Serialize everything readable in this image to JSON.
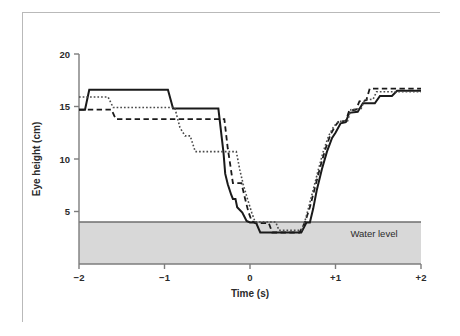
{
  "figure": {
    "frame_color": "#b9b9b9",
    "background": "#ffffff"
  },
  "chart_data": {
    "type": "line",
    "title": "",
    "subtitle": "",
    "xlabel": "Time (s)",
    "ylabel": "Eye height (cm)",
    "xlim": [
      -2,
      2
    ],
    "ylim": [
      0,
      20
    ],
    "xticks": [
      -2,
      -1,
      0,
      1,
      2
    ],
    "xtick_labels": [
      "−2",
      "−1",
      "0",
      "+1",
      "+2"
    ],
    "yticks": [
      5,
      10,
      15,
      20
    ],
    "ytick_labels": [
      "5",
      "10",
      "15",
      "20"
    ],
    "grid": false,
    "legend_position": "none",
    "annotations": [
      {
        "name": "water-level-label",
        "text": "Water level",
        "x": 1.45,
        "y": 2.6
      }
    ],
    "shaded_regions": [
      {
        "name": "water-body",
        "label": "Water level",
        "from_y": 0,
        "to_y": 4.0,
        "color": "#d8d8d8",
        "edge_color": "#6e6e6e"
      }
    ],
    "series": [
      {
        "name": "trial-1",
        "style": "solid",
        "color": "#1a1a1a",
        "width": 2.0,
        "points": [
          [
            -2.0,
            14.7
          ],
          [
            -1.93,
            14.7
          ],
          [
            -1.88,
            16.6
          ],
          [
            -1.82,
            16.6
          ],
          [
            -0.96,
            16.6
          ],
          [
            -0.9,
            14.8
          ],
          [
            -0.42,
            14.8
          ],
          [
            -0.37,
            14.8
          ],
          [
            -0.31,
            10.6
          ],
          [
            -0.29,
            8.6
          ],
          [
            -0.26,
            7.6
          ],
          [
            -0.22,
            6.6
          ],
          [
            -0.2,
            6.2
          ],
          [
            -0.17,
            6.2
          ],
          [
            -0.15,
            5.4
          ],
          [
            -0.09,
            4.9
          ],
          [
            -0.04,
            4.1
          ],
          [
            0.0,
            3.95
          ],
          [
            0.07,
            3.95
          ],
          [
            0.12,
            3.0
          ],
          [
            0.6,
            3.0
          ],
          [
            0.66,
            3.95
          ],
          [
            0.7,
            3.95
          ],
          [
            0.74,
            5.3
          ],
          [
            0.78,
            7.0
          ],
          [
            0.84,
            9.0
          ],
          [
            0.9,
            10.7
          ],
          [
            0.96,
            12.0
          ],
          [
            1.0,
            12.5
          ],
          [
            1.06,
            13.4
          ],
          [
            1.12,
            13.5
          ],
          [
            1.16,
            14.4
          ],
          [
            1.26,
            14.5
          ],
          [
            1.32,
            15.3
          ],
          [
            1.46,
            15.3
          ],
          [
            1.52,
            16.0
          ],
          [
            1.66,
            16.0
          ],
          [
            1.72,
            16.5
          ],
          [
            2.0,
            16.5
          ]
        ]
      },
      {
        "name": "trial-2",
        "style": "dashed",
        "color": "#1a1a1a",
        "width": 1.8,
        "points": [
          [
            -2.0,
            14.7
          ],
          [
            -1.62,
            14.7
          ],
          [
            -1.57,
            13.8
          ],
          [
            -0.36,
            13.8
          ],
          [
            -0.3,
            13.8
          ],
          [
            -0.26,
            11.0
          ],
          [
            -0.23,
            9.4
          ],
          [
            -0.2,
            7.7
          ],
          [
            -0.1,
            7.7
          ],
          [
            -0.06,
            6.3
          ],
          [
            -0.02,
            5.0
          ],
          [
            0.02,
            4.1
          ],
          [
            0.06,
            3.9
          ],
          [
            0.22,
            3.9
          ],
          [
            0.26,
            3.0
          ],
          [
            0.58,
            3.0
          ],
          [
            0.64,
            3.9
          ],
          [
            0.7,
            5.4
          ],
          [
            0.76,
            7.3
          ],
          [
            0.82,
            9.2
          ],
          [
            0.88,
            10.9
          ],
          [
            0.94,
            12.3
          ],
          [
            1.0,
            13.2
          ],
          [
            1.04,
            13.6
          ],
          [
            1.12,
            13.6
          ],
          [
            1.16,
            14.6
          ],
          [
            1.24,
            14.7
          ],
          [
            1.28,
            15.5
          ],
          [
            1.36,
            15.6
          ],
          [
            1.4,
            16.7
          ],
          [
            2.0,
            16.7
          ]
        ]
      },
      {
        "name": "trial-3",
        "style": "dotted",
        "color": "#4a4a4a",
        "width": 1.6,
        "points": [
          [
            -2.0,
            15.9
          ],
          [
            -1.66,
            15.9
          ],
          [
            -1.6,
            14.9
          ],
          [
            -0.93,
            14.9
          ],
          [
            -0.88,
            14.9
          ],
          [
            -0.82,
            13.0
          ],
          [
            -0.76,
            12.2
          ],
          [
            -0.7,
            12.2
          ],
          [
            -0.64,
            10.7
          ],
          [
            -0.22,
            10.7
          ],
          [
            -0.16,
            10.7
          ],
          [
            -0.12,
            9.0
          ],
          [
            -0.08,
            7.6
          ],
          [
            -0.03,
            6.2
          ],
          [
            0.02,
            4.9
          ],
          [
            0.06,
            4.0
          ],
          [
            0.3,
            4.0
          ],
          [
            0.34,
            3.2
          ],
          [
            0.6,
            3.2
          ],
          [
            0.64,
            4.0
          ],
          [
            0.68,
            5.2
          ],
          [
            0.74,
            7.1
          ],
          [
            0.8,
            9.0
          ],
          [
            0.86,
            10.8
          ],
          [
            0.92,
            12.2
          ],
          [
            0.98,
            13.1
          ],
          [
            1.04,
            13.6
          ],
          [
            1.14,
            13.6
          ],
          [
            1.18,
            14.7
          ],
          [
            1.3,
            14.8
          ],
          [
            1.34,
            15.6
          ],
          [
            1.44,
            15.7
          ],
          [
            1.48,
            16.4
          ],
          [
            2.0,
            16.4
          ]
        ]
      }
    ]
  }
}
